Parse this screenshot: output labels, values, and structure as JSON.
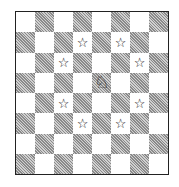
{
  "diagram": {
    "type": "chess-knight-moves",
    "board": {
      "rows": 8,
      "cols": 8,
      "top_left_color": "light"
    },
    "colors": {
      "light": "#ffffff",
      "dark_hatch": "#8a8a8a",
      "border": "#222222"
    },
    "knight": {
      "row": 3,
      "col": 4,
      "glyph": "♘",
      "icon": "white-knight-icon"
    },
    "targets": {
      "glyph": "☆",
      "icon": "star-icon",
      "squares": [
        {
          "row": 1,
          "col": 3
        },
        {
          "row": 1,
          "col": 5
        },
        {
          "row": 2,
          "col": 2
        },
        {
          "row": 2,
          "col": 6
        },
        {
          "row": 4,
          "col": 2
        },
        {
          "row": 4,
          "col": 6
        },
        {
          "row": 5,
          "col": 3
        },
        {
          "row": 5,
          "col": 5
        }
      ]
    }
  }
}
